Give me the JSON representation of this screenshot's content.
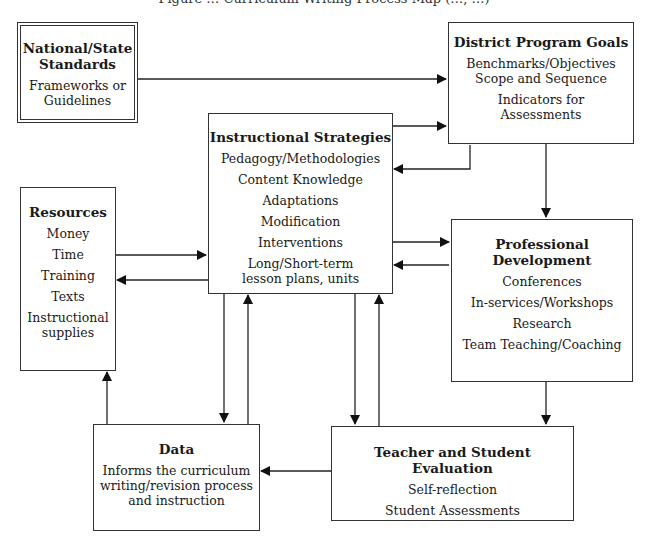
{
  "title": "Figure … Curriculum Writing Process Map (…, …)",
  "nodes": {
    "standards": {
      "heading": "National/State Standards",
      "heading_lines": [
        "National/State",
        "Standards"
      ],
      "items": [
        "Frameworks or",
        "Guidelines"
      ]
    },
    "district": {
      "heading": "District Program Goals",
      "items": [
        "Benchmarks/Objectives",
        "Scope and Sequence",
        "Indicators for",
        "Assessments"
      ]
    },
    "instructional": {
      "heading": "Instructional Strategies",
      "items": [
        "Pedagogy/Methodologies",
        "Content Knowledge",
        "Adaptations",
        "Modification",
        "Interventions",
        "Long/Short-term",
        "lesson plans, units"
      ]
    },
    "resources": {
      "heading": "Resources",
      "items": [
        "Money",
        "Time",
        "Training",
        "Texts",
        "Instructional",
        "supplies"
      ]
    },
    "professional": {
      "heading": "Professional Development",
      "items": [
        "Conferences",
        "In-services/Workshops",
        "Research",
        "Team Teaching/Coaching"
      ]
    },
    "data": {
      "heading": "Data",
      "items": [
        "Informs the curriculum",
        "writing/revision process",
        "and instruction"
      ]
    },
    "evaluation": {
      "heading": "Teacher and Student Evaluation",
      "items": [
        "Self-reflection",
        "Student Assessments"
      ]
    }
  },
  "edges": [
    {
      "from": "National/State Standards",
      "to": "District Program Goals"
    },
    {
      "from": "Instructional Strategies",
      "to": "District Program Goals"
    },
    {
      "from": "District Program Goals",
      "to": "Instructional Strategies"
    },
    {
      "from": "District Program Goals",
      "to": "Professional Development"
    },
    {
      "from": "Instructional Strategies",
      "to": "Professional Development"
    },
    {
      "from": "Professional Development",
      "to": "Instructional Strategies"
    },
    {
      "from": "Resources",
      "to": "Instructional Strategies"
    },
    {
      "from": "Instructional Strategies",
      "to": "Resources"
    },
    {
      "from": "Instructional Strategies",
      "to": "Data"
    },
    {
      "from": "Data",
      "to": "Instructional Strategies"
    },
    {
      "from": "Instructional Strategies",
      "to": "Teacher and Student Evaluation"
    },
    {
      "from": "Teacher and Student Evaluation",
      "to": "Instructional Strategies"
    },
    {
      "from": "Professional Development",
      "to": "Teacher and Student Evaluation"
    },
    {
      "from": "Teacher and Student Evaluation",
      "to": "Data"
    },
    {
      "from": "Data",
      "to": "Resources"
    }
  ]
}
